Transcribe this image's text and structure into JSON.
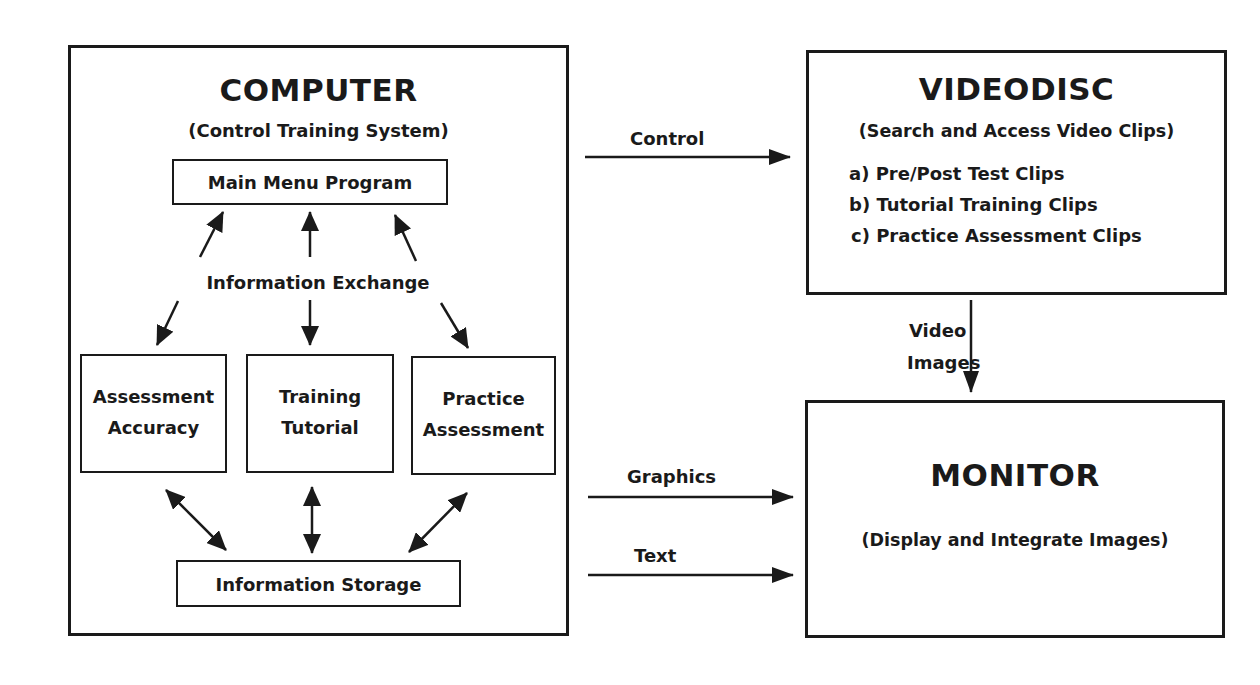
{
  "computer": {
    "title": "COMPUTER",
    "subtitle": "(Control Training System)",
    "main_menu": "Main Menu Program",
    "exchange_label": "Information Exchange",
    "modules": [
      {
        "line1": "Assessment",
        "line2": "Accuracy"
      },
      {
        "line1": "Training",
        "line2": "Tutorial"
      },
      {
        "line1": "Practice",
        "line2": "Assessment"
      }
    ],
    "storage": "Information Storage"
  },
  "videodisc": {
    "title": "VIDEODISC",
    "subtitle": "(Search and Access Video Clips)",
    "items": [
      "a) Pre/Post Test Clips",
      "b) Tutorial Training Clips",
      "c) Practice Assessment Clips"
    ]
  },
  "monitor": {
    "title": "MONITOR",
    "subtitle": "(Display and Integrate Images)"
  },
  "connections": {
    "control": "Control",
    "video_line1": "Video",
    "video_line2": "Images",
    "graphics": "Graphics",
    "text": "Text"
  },
  "colors": {
    "ink": "#1a1a1a",
    "paper": "#ffffff"
  }
}
